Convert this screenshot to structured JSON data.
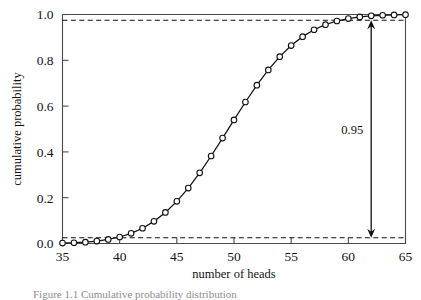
{
  "figure": {
    "caption": "Figure 1.1  Cumulative probability distribution"
  },
  "chart_data": {
    "type": "line",
    "title": "",
    "xlabel": "number of heads",
    "ylabel": "cumulative probability",
    "xlim": [
      35,
      65
    ],
    "ylim": [
      0.0,
      1.0
    ],
    "xticks": [
      35,
      40,
      45,
      50,
      55,
      60,
      65
    ],
    "xticklabels": [
      "35",
      "40",
      "45",
      "50",
      "55",
      "60",
      "65"
    ],
    "yticks": [
      0.0,
      0.2,
      0.4,
      0.6,
      0.8,
      1.0
    ],
    "yticklabels": [
      "0.0",
      "0.2",
      "0.4",
      "0.6",
      "0.8",
      "1.0"
    ],
    "grid": false,
    "legend": null,
    "marker": "open-circle",
    "x": [
      35,
      36,
      37,
      38,
      39,
      40,
      41,
      42,
      43,
      44,
      45,
      46,
      47,
      48,
      49,
      50,
      51,
      52,
      53,
      54,
      55,
      56,
      57,
      58,
      59,
      60,
      61,
      62,
      63,
      64,
      65
    ],
    "y": [
      0.0018,
      0.0033,
      0.006,
      0.0105,
      0.0176,
      0.0284,
      0.0443,
      0.0666,
      0.0967,
      0.1356,
      0.1841,
      0.2421,
      0.3086,
      0.3822,
      0.4602,
      0.5398,
      0.6178,
      0.6914,
      0.7579,
      0.8159,
      0.8644,
      0.9033,
      0.9334,
      0.9557,
      0.9716,
      0.9824,
      0.9895,
      0.994,
      0.9967,
      0.9982,
      0.9991
    ],
    "reference_lines": [
      {
        "name": "lower-bound",
        "value": 0.025,
        "style": "dashed"
      },
      {
        "name": "upper-bound",
        "value": 0.975,
        "style": "dashed"
      }
    ],
    "annotations": [
      {
        "name": "interval-label",
        "text": "0.95",
        "x": 62,
        "y_from": 0.025,
        "y_to": 0.975,
        "arrow": "double-headed"
      }
    ],
    "colors": {
      "curve": "#111111",
      "marker_fill": "#ffffff",
      "axis": "#4a4a4a",
      "reference": "#111111"
    }
  }
}
